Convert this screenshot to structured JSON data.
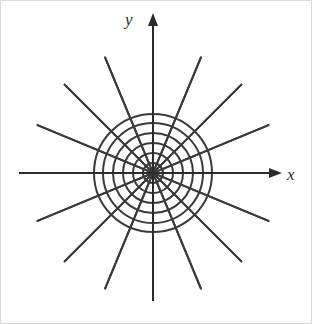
{
  "figure": {
    "kind": "polar-coordinate-grid",
    "width": 312,
    "height": 324,
    "background_color": "#ffffff",
    "border_color": "#d8d8d8",
    "stroke_color": "#3a3a3a",
    "axis_color": "#2b2b2b",
    "stroke_width": 2.0,
    "axis_width": 2.0,
    "origin": {
      "x": 152,
      "y": 172
    }
  },
  "axes": {
    "x_axis": {
      "label": "x",
      "label_x": 286,
      "label_y": 165,
      "start_x": 18,
      "end_x": 281,
      "y": 172,
      "arrowhead": "right",
      "icon": "arrow-right-icon"
    },
    "y_axis": {
      "label": "y",
      "label_x": 124,
      "label_y": 10,
      "start_y": 300,
      "end_y": 12,
      "x": 152,
      "arrowhead": "up",
      "icon": "arrow-up-icon"
    }
  },
  "chart_data": {
    "type": "line",
    "title": "",
    "subtitle": "",
    "xlabel": "x",
    "ylabel": "y",
    "grid": true,
    "legend_position": "none",
    "coordinate_system": "polar",
    "circle_count": 6,
    "circle_radii_px": [
      10,
      20,
      30,
      40,
      50,
      59
    ],
    "spoke_count": 16,
    "spoke_angle_step_deg": 22.5,
    "spoke_angles_deg": [
      0,
      22.5,
      45,
      67.5,
      90,
      112.5,
      135,
      157.5,
      180,
      202.5,
      225,
      247.5,
      270,
      292.5,
      315,
      337.5
    ],
    "spoke_outer_radius_px": 125,
    "axis_ticks": [],
    "tick_labels": [],
    "annotations": [],
    "xlim": [
      -134,
      129
    ],
    "ylim": [
      -128,
      160
    ]
  }
}
